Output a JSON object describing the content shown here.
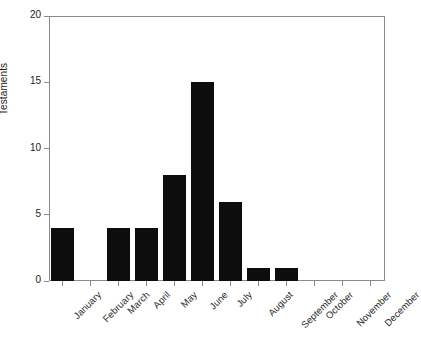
{
  "chart_data": {
    "type": "bar",
    "title": "",
    "xlabel": "",
    "ylabel": "Testaments",
    "categories": [
      "January",
      "February",
      "March",
      "April",
      "May",
      "June",
      "July",
      "August",
      "September",
      "October",
      "November",
      "December"
    ],
    "values": [
      4,
      0,
      4,
      4,
      8,
      15,
      6,
      1,
      1,
      0,
      0,
      0
    ],
    "ylim": [
      0,
      20
    ],
    "yticks": [
      0,
      5,
      10,
      15,
      20
    ],
    "ytick_labels": [
      "0",
      "5",
      "10",
      "15",
      "20"
    ],
    "grid": false,
    "legend": false,
    "bar_color": "#0d0d0d",
    "frame_color": "#8b8b8b",
    "background": "#ffffff",
    "label_rotation": -45
  }
}
